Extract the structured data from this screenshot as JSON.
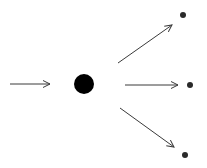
{
  "diagram": {
    "width": 207,
    "height": 168,
    "background": "#ffffff",
    "stroke_color": "#3a3a3a",
    "node_color": "#000000",
    "small_node_color": "#2a2a2a",
    "source_node": {
      "cx": 84,
      "cy": 84,
      "r": 10
    },
    "input_arrow": {
      "x1": 10,
      "y1": 84,
      "x2": 50,
      "y2": 84
    },
    "output_arrows": [
      {
        "x1": 118,
        "y1": 63,
        "x2": 172,
        "y2": 25
      },
      {
        "x1": 125,
        "y1": 85,
        "x2": 178,
        "y2": 85
      },
      {
        "x1": 120,
        "y1": 108,
        "x2": 174,
        "y2": 147
      }
    ],
    "target_nodes": [
      {
        "cx": 183,
        "cy": 15,
        "r": 3
      },
      {
        "cx": 190,
        "cy": 85,
        "r": 3
      },
      {
        "cx": 185,
        "cy": 155,
        "r": 3
      }
    ]
  }
}
